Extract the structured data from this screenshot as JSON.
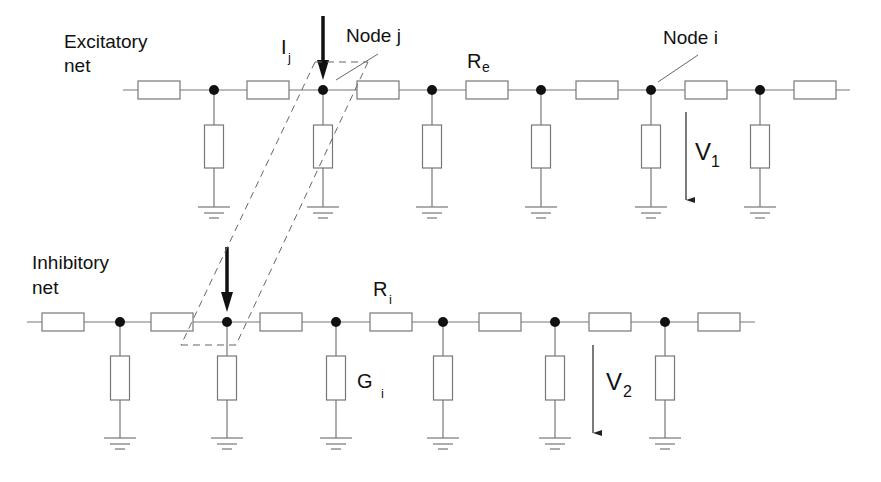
{
  "excitatory_net": {
    "label_line1": "Excitatory",
    "label_line2": "net",
    "resistor_label": "R",
    "resistor_label_sub": "e",
    "current_label": "I",
    "current_label_sub": "j",
    "node_j_label": "Node j",
    "node_i_label": "Node i",
    "voltage_label": "V",
    "voltage_label_sub": "1",
    "line_y": 90,
    "line_x_start": 123,
    "line_x_end": 850,
    "series_resistor_centers": [
      159,
      268,
      378,
      487,
      597,
      706,
      815
    ],
    "node_x": [
      214,
      323,
      432,
      541,
      651,
      760
    ]
  },
  "inhibitory_net": {
    "label_line1": "Inhibitory",
    "label_line2": "net",
    "resistor_label": "R",
    "resistor_label_sub": "i",
    "conductance_label": "G",
    "conductance_label_sub": "i",
    "voltage_label": "V",
    "voltage_label_sub": "2",
    "line_y": 322,
    "line_x_start": 27,
    "line_x_end": 755,
    "series_resistor_centers": [
      63,
      172,
      281,
      391,
      500,
      610,
      719
    ],
    "node_x": [
      120,
      227,
      336,
      443,
      555,
      665
    ]
  },
  "colors": {
    "wire": "#777777",
    "ink": "#111111",
    "background": "#ffffff"
  }
}
